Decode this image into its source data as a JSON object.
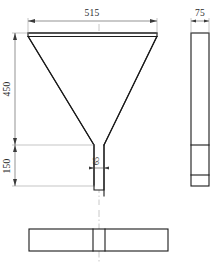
{
  "drawing": {
    "type": "engineering-orthographic-drawing",
    "subject": "funnel-hopper",
    "units": "mm",
    "views": [
      {
        "id": "front-elevation",
        "name": "Front Elevation"
      },
      {
        "id": "right-side-view",
        "name": "Right Side View"
      },
      {
        "id": "bottom-plan-view",
        "name": "Bottom Plan View"
      }
    ],
    "dimensions": {
      "top_width": "515",
      "upper_height": "450",
      "lower_height": "150",
      "neck_width": "65",
      "thickness": "75"
    },
    "colors": {
      "object_line": "#1a1a1a",
      "dimension_line": "#4a4a4a",
      "extension_line": "#8a8a8a",
      "center_line": "#9a9a9a",
      "background": "#ffffff"
    }
  }
}
